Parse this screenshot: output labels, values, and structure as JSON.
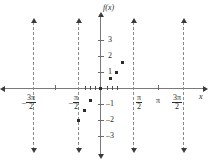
{
  "chart_data": {
    "type": "scatter",
    "title": "",
    "xlabel": "x",
    "ylabel": "f(x)",
    "xlim": [
      -5.8,
      5.8
    ],
    "ylim": [
      -3.8,
      3.8
    ],
    "grid": false,
    "legend": "none",
    "x_tick_labels": [
      "-3π/2",
      "-π/2",
      "π/2",
      "π",
      "3π/2"
    ],
    "x_tick_values": [
      -4.712,
      -1.571,
      1.571,
      3.142,
      4.712
    ],
    "y_tick_labels": [
      "3",
      "2",
      "1",
      "-1",
      "-2",
      "-3"
    ],
    "y_tick_values": [
      3,
      2,
      1,
      -1,
      -2,
      -3
    ],
    "asymptotes": [
      -4.712,
      -1.571,
      1.571,
      4.712
    ],
    "points": [
      {
        "x": -0.98,
        "y": -2.0
      },
      {
        "x": -0.72,
        "y": -1.35
      },
      {
        "x": -0.46,
        "y": -0.75
      },
      {
        "x": 0.0,
        "y": 0.0
      },
      {
        "x": 0.46,
        "y": 0.62
      },
      {
        "x": 0.72,
        "y": 1.0
      },
      {
        "x": 0.98,
        "y": 1.65
      }
    ],
    "series": [
      {
        "name": "f(x)",
        "x": [
          -0.98,
          -0.72,
          -0.46,
          0.0,
          0.46,
          0.72,
          0.98
        ],
        "values": [
          -2.0,
          -1.35,
          -0.75,
          0.0,
          0.62,
          1.0,
          1.65
        ]
      }
    ]
  },
  "labels": {
    "y_axis_name": "f(x)",
    "x_axis_name": "x",
    "y_ticks": {
      "t3": "3",
      "t2": "2",
      "t1": "1",
      "tm1": "1",
      "tm2": "2",
      "tm3": "3",
      "minus": "–"
    },
    "x_ticks": {
      "neg_three_pi_over_two": {
        "sign": "–",
        "num": "3π",
        "den": "2"
      },
      "neg_pi_over_two": {
        "sign": "–",
        "num": "π",
        "den": "2"
      },
      "pi_over_two": {
        "num": "π",
        "den": "2"
      },
      "pi": "π",
      "three_pi_over_two": {
        "num": "3π",
        "den": "2"
      }
    }
  },
  "colors": {
    "axis": "#7a7a7a",
    "point": "#2b2b2b",
    "asymptote": "#8a8a8a",
    "text": "#2b2b2b",
    "background": "#ffffff"
  }
}
